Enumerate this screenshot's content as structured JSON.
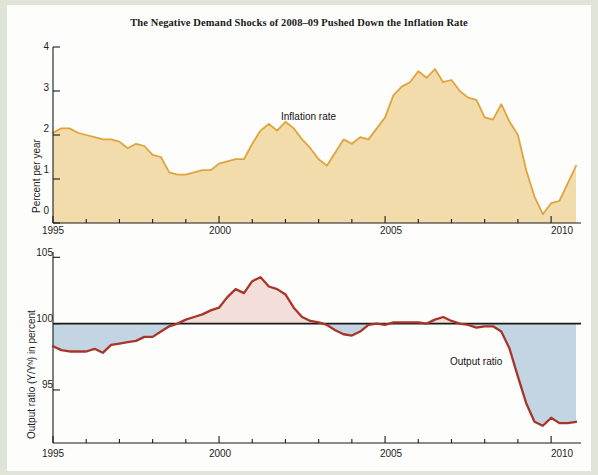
{
  "figure": {
    "title": "The Negative Demand Shocks of 2008–09 Pushed Down the Inflation Rate",
    "colors": {
      "inflation_fill": "#f3dcab",
      "inflation_line": "#e0a43f",
      "output_line": "#a8352a",
      "positive_gap_fill": "#f4ded9",
      "negative_gap_fill": "#c3d5e3",
      "axis": "#1a1a1a",
      "page_background": "#fdfdfb",
      "outer_background": "#dfe3d8"
    }
  },
  "chart_data": [
    {
      "type": "area",
      "id": "inflation-panel",
      "title": "",
      "series_label": "Inflation rate",
      "xlabel": "",
      "ylabel": "Percent per year",
      "xlim": [
        1995.0,
        2010.9
      ],
      "ylim": [
        0,
        4
      ],
      "yticks": [
        0,
        1,
        2,
        3,
        4
      ],
      "ytick_labels": [
        "0",
        "1",
        "2",
        "3",
        "4"
      ],
      "xticks": [
        1995,
        2000,
        2005,
        2010
      ],
      "xtick_labels": [
        "1995",
        "2000",
        "2005",
        "2010"
      ],
      "xminor_step": 1,
      "grid": false,
      "legend": "inline-annotation",
      "x": [
        1995.0,
        1995.25,
        1995.5,
        1995.75,
        1996.0,
        1996.25,
        1996.5,
        1996.75,
        1997.0,
        1997.25,
        1997.5,
        1997.75,
        1998.0,
        1998.25,
        1998.5,
        1998.75,
        1999.0,
        1999.25,
        1999.5,
        1999.75,
        2000.0,
        2000.25,
        2000.5,
        2000.75,
        2001.0,
        2001.25,
        2001.5,
        2001.75,
        2002.0,
        2002.25,
        2002.5,
        2002.75,
        2003.0,
        2003.25,
        2003.5,
        2003.75,
        2004.0,
        2004.25,
        2004.5,
        2004.75,
        2005.0,
        2005.25,
        2005.5,
        2005.75,
        2006.0,
        2006.25,
        2006.5,
        2006.75,
        2007.0,
        2007.25,
        2007.5,
        2007.75,
        2008.0,
        2008.25,
        2008.5,
        2008.75,
        2009.0,
        2009.25,
        2009.5,
        2009.75,
        2010.0,
        2010.25,
        2010.5,
        2010.75
      ],
      "values": [
        2.05,
        2.15,
        2.15,
        2.05,
        2.0,
        1.95,
        1.9,
        1.9,
        1.85,
        1.7,
        1.8,
        1.75,
        1.55,
        1.5,
        1.15,
        1.1,
        1.1,
        1.15,
        1.2,
        1.2,
        1.35,
        1.4,
        1.45,
        1.45,
        1.8,
        2.1,
        2.25,
        2.1,
        2.3,
        2.15,
        1.9,
        1.7,
        1.45,
        1.3,
        1.6,
        1.9,
        1.8,
        1.95,
        1.9,
        2.15,
        2.4,
        2.9,
        3.1,
        3.2,
        3.45,
        3.3,
        3.5,
        3.2,
        3.25,
        3.0,
        2.85,
        2.8,
        2.4,
        2.35,
        2.7,
        2.3,
        2.0,
        1.2,
        0.6,
        0.2,
        0.45,
        0.5,
        0.9,
        1.3
      ]
    },
    {
      "type": "line",
      "id": "output-ratio-panel",
      "title": "",
      "series_label": "Output ratio",
      "xlabel": "",
      "ylabel": "Output ratio (Y/Yᴺ) in percent",
      "xlim": [
        1995.0,
        2010.9
      ],
      "ylim": [
        91.0,
        105.4
      ],
      "yticks": [
        95,
        100,
        105
      ],
      "ytick_labels": [
        "95",
        "100",
        "105"
      ],
      "xticks": [
        1995,
        2000,
        2005,
        2010
      ],
      "xtick_labels": [
        "1995",
        "2000",
        "2005",
        "2010"
      ],
      "xminor_step": 1,
      "reference_line": 100,
      "grid": false,
      "legend": "inline-annotation",
      "x": [
        1995.0,
        1995.25,
        1995.5,
        1995.75,
        1996.0,
        1996.25,
        1996.5,
        1996.75,
        1997.0,
        1997.25,
        1997.5,
        1997.75,
        1998.0,
        1998.25,
        1998.5,
        1998.75,
        1999.0,
        1999.25,
        1999.5,
        1999.75,
        2000.0,
        2000.25,
        2000.5,
        2000.75,
        2001.0,
        2001.25,
        2001.5,
        2001.75,
        2002.0,
        2002.25,
        2002.5,
        2002.75,
        2003.0,
        2003.25,
        2003.5,
        2003.75,
        2004.0,
        2004.25,
        2004.5,
        2004.75,
        2005.0,
        2005.25,
        2005.5,
        2005.75,
        2006.0,
        2006.25,
        2006.5,
        2006.75,
        2007.0,
        2007.25,
        2007.5,
        2007.75,
        2008.0,
        2008.25,
        2008.5,
        2008.75,
        2009.0,
        2009.25,
        2009.5,
        2009.75,
        2010.0,
        2010.25,
        2010.5,
        2010.75
      ],
      "values": [
        98.3,
        98.0,
        97.9,
        97.9,
        97.9,
        98.1,
        97.8,
        98.4,
        98.5,
        98.6,
        98.7,
        99.0,
        99.0,
        99.4,
        99.8,
        100.0,
        100.3,
        100.5,
        100.7,
        101.0,
        101.2,
        102.0,
        102.6,
        102.3,
        103.2,
        103.5,
        102.8,
        102.6,
        102.2,
        101.2,
        100.5,
        100.2,
        100.1,
        99.9,
        99.5,
        99.2,
        99.1,
        99.4,
        99.9,
        100.0,
        99.9,
        100.1,
        100.1,
        100.1,
        100.1,
        100.0,
        100.3,
        100.5,
        100.2,
        100.0,
        99.9,
        99.7,
        99.8,
        99.8,
        99.4,
        98.1,
        96.0,
        94.0,
        92.6,
        92.3,
        92.9,
        92.5,
        92.5,
        92.6
      ]
    }
  ]
}
